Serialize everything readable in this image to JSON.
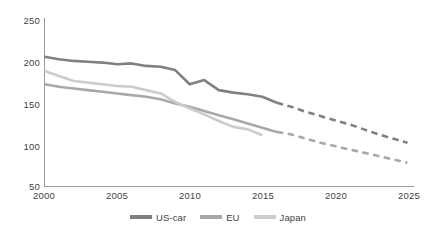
{
  "chart_data": {
    "type": "line",
    "title": "",
    "subtitle": "",
    "xlabel": "",
    "ylabel": "",
    "xlim": [
      2000,
      2025
    ],
    "ylim": [
      50,
      250
    ],
    "xticks": [
      "2000",
      "2005",
      "2010",
      "2015",
      "2020",
      "2025"
    ],
    "yticks": [
      "50",
      "100",
      "150",
      "200",
      "250"
    ],
    "grid": false,
    "legend_position": "bottom",
    "x": [
      2000,
      2001,
      2002,
      2003,
      2004,
      2005,
      2006,
      2007,
      2008,
      2009,
      2010,
      2011,
      2012,
      2013,
      2014,
      2015,
      2016,
      2017,
      2018,
      2019,
      2020,
      2021,
      2022,
      2023,
      2024,
      2025
    ],
    "series": [
      {
        "name": "US-car",
        "color": "#808080",
        "solid_through": 2016,
        "dashed_from": 2016,
        "values": [
          206,
          203,
          201,
          200,
          199,
          197,
          198,
          195,
          194,
          190,
          173,
          178,
          166,
          163,
          161,
          158,
          151,
          146,
          140,
          135,
          130,
          125,
          119,
          113,
          108,
          103
        ]
      },
      {
        "name": "EU",
        "color": "#a8a8a8",
        "solid_through": 2016,
        "dashed_from": 2016,
        "values": [
          173,
          170,
          168,
          166,
          164,
          162,
          160,
          158,
          155,
          150,
          146,
          141,
          136,
          131,
          126,
          121,
          116,
          113,
          108,
          103,
          99,
          95,
          91,
          87,
          83,
          79
        ]
      },
      {
        "name": "Japan",
        "color": "#cccccc",
        "solid_through": 2015,
        "dashed_from": null,
        "values": [
          189,
          183,
          177,
          175,
          173,
          171,
          170,
          166,
          162,
          152,
          144,
          137,
          129,
          122,
          119,
          112,
          null,
          null,
          null,
          null,
          null,
          null,
          null,
          null,
          null,
          null
        ]
      }
    ]
  },
  "legend": {
    "items": [
      {
        "label": "US-car"
      },
      {
        "label": "EU"
      },
      {
        "label": "Japan"
      }
    ]
  }
}
